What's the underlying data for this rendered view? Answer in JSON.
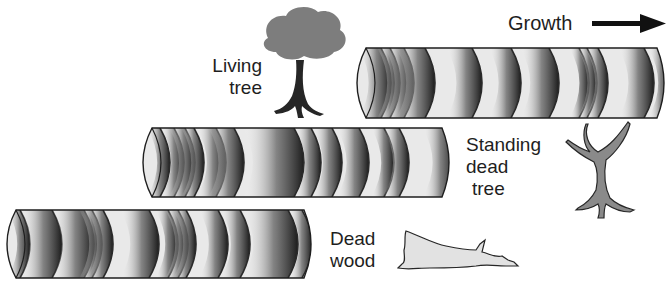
{
  "diagram": {
    "growth_label": "Growth",
    "growth_arrow": "right-arrow",
    "labels": {
      "living_tree": [
        "Living",
        "tree"
      ],
      "standing_dead_tree": [
        "Standing",
        "dead",
        "tree"
      ],
      "dead_wood": [
        "Dead",
        "wood"
      ]
    },
    "colors": {
      "core_fill": "#e9e9e9",
      "ring_dark": "#2a2a2a",
      "living_tree_crown": "#7d7d7d",
      "trunk": "#262626",
      "dead_tree": "#8a8a8a",
      "dead_wood": "#e2e2e2",
      "text": "#1e1e1e"
    },
    "cores": [
      {
        "name": "living-tree-core",
        "x": 352,
        "y": 48,
        "w": 313,
        "h": 70,
        "rings": [
          [
            22,
            7
          ],
          [
            34,
            4
          ],
          [
            46,
            6
          ],
          [
            64,
            9
          ],
          [
            112,
            8
          ],
          [
            152,
            7
          ],
          [
            188,
            9
          ],
          [
            224,
            3
          ],
          [
            232,
            3
          ],
          [
            242,
            4
          ],
          [
            284,
            8
          ],
          [
            305,
            4
          ]
        ]
      },
      {
        "name": "standing-dead-tree-core",
        "x": 138,
        "y": 128,
        "w": 312,
        "h": 69,
        "rings": [
          [
            18,
            4
          ],
          [
            32,
            4
          ],
          [
            42,
            5
          ],
          [
            52,
            4
          ],
          [
            72,
            6
          ],
          [
            88,
            8
          ],
          [
            140,
            16
          ],
          [
            168,
            5
          ],
          [
            188,
            6
          ],
          [
            214,
            7
          ],
          [
            242,
            4
          ],
          [
            256,
            5
          ],
          [
            300,
            7
          ]
        ]
      },
      {
        "name": "dead-wood-core",
        "x": 2,
        "y": 210,
        "w": 310,
        "h": 68,
        "rings": [
          [
            14,
            4
          ],
          [
            40,
            10
          ],
          [
            72,
            10
          ],
          [
            86,
            4
          ],
          [
            96,
            5
          ],
          [
            138,
            9
          ],
          [
            162,
            4
          ],
          [
            172,
            4
          ],
          [
            180,
            4
          ],
          [
            210,
            6
          ],
          [
            232,
            6
          ],
          [
            272,
            14
          ],
          [
            296,
            4
          ]
        ]
      }
    ]
  }
}
